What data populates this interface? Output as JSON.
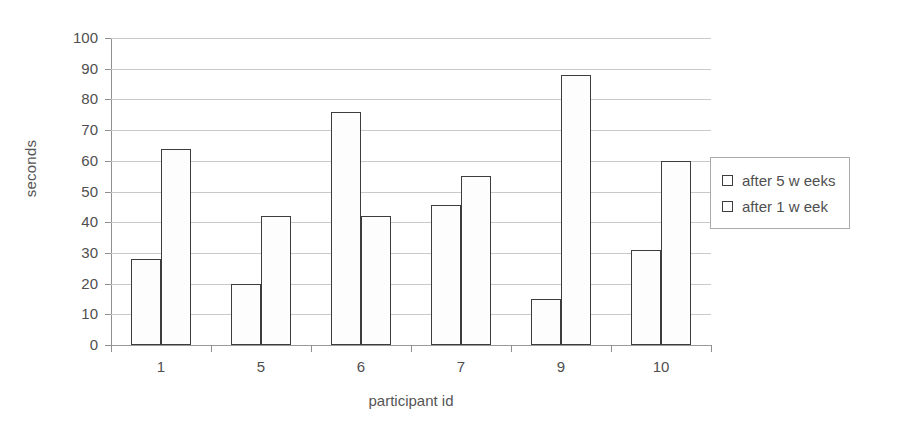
{
  "chart_data": {
    "type": "bar",
    "title": "",
    "xlabel": "participant id",
    "ylabel": "seconds",
    "categories": [
      "1",
      "5",
      "6",
      "7",
      "9",
      "10"
    ],
    "series": [
      {
        "name": "after 5 w eeks",
        "values": [
          28,
          20,
          76,
          45.5,
          15,
          31
        ]
      },
      {
        "name": "after 1 w eek",
        "values": [
          64,
          42,
          42,
          55,
          88,
          60
        ]
      }
    ],
    "ylim": [
      0,
      100
    ],
    "ytick_labels": [
      "100",
      "90",
      "80",
      "70",
      "60",
      "50",
      "40",
      "30",
      "20",
      "10",
      "0"
    ],
    "ytick_values": [
      100,
      90,
      80,
      70,
      60,
      50,
      40,
      30,
      20,
      10,
      0
    ],
    "grid": "horizontal",
    "legend_position": "right",
    "colors": {
      "bar_fill": "#fdfdfd",
      "bar_border": "#3d3d3d",
      "gridline": "#c9c9c9",
      "axis": "#8f8f8f",
      "text": "#4f4f4f",
      "background": "#ffffff"
    }
  },
  "legend": {
    "entries": [
      {
        "label": "after 5 w eeks"
      },
      {
        "label": "after 1 w eek"
      }
    ]
  },
  "axes": {
    "x_title": "participant id",
    "y_title": "seconds"
  }
}
